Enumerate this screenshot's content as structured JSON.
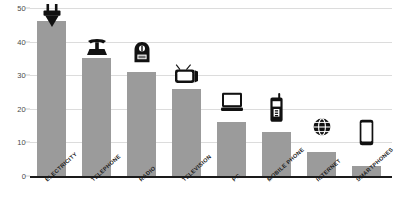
{
  "chart_data": {
    "type": "bar",
    "title": "",
    "subtitle": "",
    "xlabel": "",
    "ylabel": "",
    "ylim": [
      0,
      50
    ],
    "yticks": [
      0,
      10,
      20,
      30,
      40,
      50
    ],
    "ytick_labels": [
      "0",
      "10",
      "20",
      "30",
      "40",
      "50"
    ],
    "grid": true,
    "legend": false,
    "categories": [
      "ELECTRICITY",
      "TELEPHONE",
      "RADIO",
      "TELEVISION",
      "PC",
      "MOBILE PHONE",
      "INTERNET",
      "SMARTPHONES"
    ],
    "values": [
      46,
      35,
      31,
      26,
      16,
      13,
      7,
      3
    ],
    "bar_color": "#9b9b9b",
    "gridline_color": "#dcdcdc",
    "axis_color": "#1a1a1a",
    "icons": [
      "plug-icon",
      "rotary-telephone-icon",
      "vintage-radio-icon",
      "television-icon",
      "desktop-computer-icon",
      "mobile-phone-icon",
      "globe-internet-icon",
      "smartphone-icon"
    ]
  }
}
